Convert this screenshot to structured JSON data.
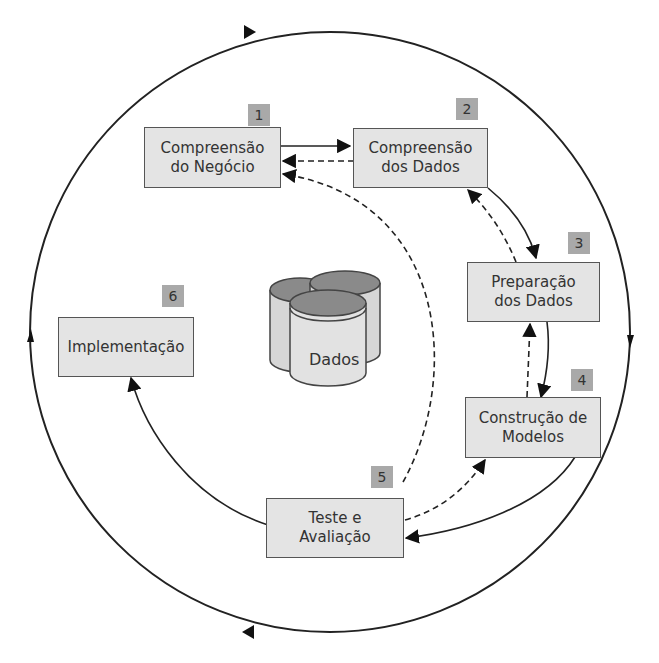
{
  "diagram": {
    "type": "CRISP-DM cycle",
    "center": {
      "label": "Dados"
    },
    "phases": [
      {
        "number": "1",
        "label_line1": "Compreensão",
        "label_line2": "do Negócio"
      },
      {
        "number": "2",
        "label_line1": "Compreensão",
        "label_line2": "dos Dados"
      },
      {
        "number": "3",
        "label_line1": "Preparação",
        "label_line2": "dos Dados"
      },
      {
        "number": "4",
        "label_line1": "Construção de",
        "label_line2": "Modelos"
      },
      {
        "number": "5",
        "label_line1": "Teste e",
        "label_line2": "Avaliação"
      },
      {
        "number": "6",
        "label_line1": "Implementação",
        "label_line2": ""
      }
    ],
    "colors": {
      "box_fill": "#e4e4e4",
      "number_tab": "#a9a9a9",
      "line": "#222222",
      "cylinder_top": "#8a8a8a",
      "cylinder_body": "#d6d6d6"
    }
  }
}
